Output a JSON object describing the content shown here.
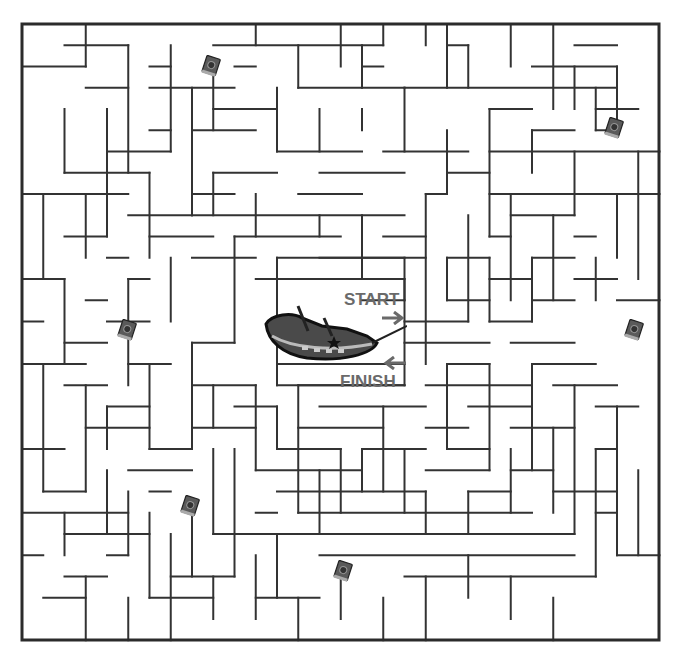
{
  "labels": {
    "start": "START",
    "finish": "FINISH",
    "start_arrow": "➔",
    "finish_arrow": "🡐"
  },
  "colors": {
    "wall": "#333333",
    "border": "#2b2b2b",
    "label": "#6a6a6a",
    "background": "#ffffff"
  },
  "maze": {
    "origin": [
      22,
      24
    ],
    "step": 21.25,
    "cols": 30,
    "rows": 29
  },
  "icons": [
    {
      "name": "spellbook-icon",
      "x": 201,
      "y": 55
    },
    {
      "name": "spellbook-icon",
      "x": 604,
      "y": 117
    },
    {
      "name": "spellbook-icon",
      "x": 117,
      "y": 319
    },
    {
      "name": "spellbook-icon",
      "x": 624,
      "y": 319
    },
    {
      "name": "spellbook-icon",
      "x": 180,
      "y": 495
    },
    {
      "name": "spellbook-icon",
      "x": 333,
      "y": 560
    }
  ],
  "center_piece": {
    "name": "pirate-ship-icon"
  }
}
